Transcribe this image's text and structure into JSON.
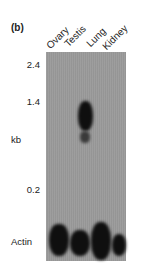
{
  "figure": {
    "panel_label": "(b)",
    "lanes": [
      "Ovary",
      "Testis",
      "Lung",
      "Kidney"
    ],
    "size_markers": [
      "2.4",
      "1.4",
      "0.2"
    ],
    "axis_unit": "kb",
    "loading_control_label": "Actin",
    "colors": {
      "gel_background": "#9a9a9a",
      "band": "#0f0f0f"
    }
  }
}
